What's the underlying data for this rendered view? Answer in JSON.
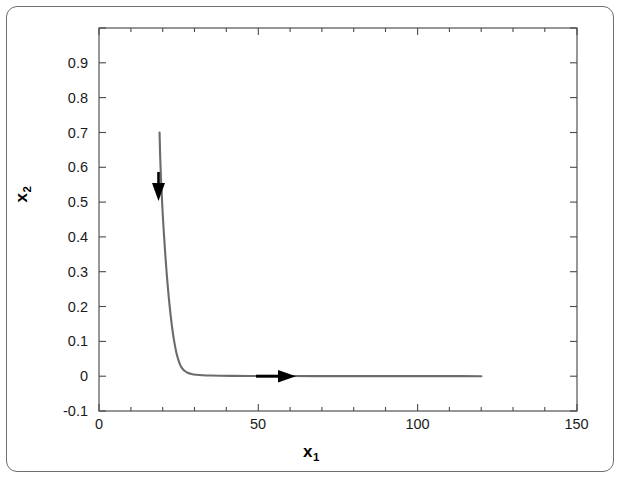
{
  "figure": {
    "background_color": "#ffffff",
    "frame_color": "#6f6f6f",
    "curve_color": "#6b6b6b",
    "arrow_color": "#000000",
    "axis_color": "#4a4a4a"
  },
  "axes": {
    "x_title": "x",
    "x_title_sub": "1",
    "y_title": "x",
    "y_title_sub": "2"
  },
  "ticks": {
    "x_labels": [
      "0",
      "50",
      "100",
      "150"
    ],
    "y_labels": [
      "0.9",
      "0.8",
      "0.7",
      "0.6",
      "0.5",
      "0.4",
      "0.3",
      "0.2",
      "0.1",
      "0",
      "-0.1"
    ]
  },
  "chart_data": {
    "type": "line",
    "title": "",
    "subtitle": "",
    "xlabel": "x1",
    "ylabel": "x2",
    "xlim": [
      0,
      150
    ],
    "ylim": [
      -0.1,
      1.0
    ],
    "xticks": [
      0,
      50,
      100,
      150
    ],
    "yticks": [
      -0.1,
      0,
      0.1,
      0.2,
      0.3,
      0.4,
      0.5,
      0.6,
      0.7,
      0.8,
      0.9,
      1.0
    ],
    "xtick_labels": [
      "0",
      "50",
      "100",
      "150"
    ],
    "ytick_labels": [
      "-0.1",
      "0",
      "0.1",
      "0.2",
      "0.3",
      "0.4",
      "0.5",
      "0.6",
      "0.7",
      "0.8",
      "0.9",
      ""
    ],
    "x_minor_ticks": [
      10,
      20,
      30,
      40,
      60,
      70,
      80,
      90,
      110,
      120,
      130,
      140
    ],
    "grid": false,
    "legend": null,
    "legend_position": "none",
    "series": [
      {
        "name": "trajectory",
        "color": "#6b6b6b",
        "linewidth": 2.1,
        "x": [
          19.0,
          19.1,
          19.2,
          19.4,
          19.7,
          20.0,
          20.4,
          20.8,
          21.2,
          21.6,
          22.0,
          22.4,
          22.8,
          23.2,
          23.6,
          24.0,
          24.4,
          24.9,
          25.4,
          26.0,
          26.8,
          27.8,
          29.0,
          30.5,
          32.5,
          35.0,
          38.0,
          42.0,
          47.0,
          53.0,
          60.0,
          68.0,
          77.0,
          87.0,
          98.0,
          109.0,
          120.0
        ],
        "y": [
          0.7,
          0.665,
          0.63,
          0.58,
          0.52,
          0.465,
          0.405,
          0.35,
          0.3,
          0.256,
          0.216,
          0.181,
          0.15,
          0.123,
          0.1,
          0.08,
          0.063,
          0.047,
          0.034,
          0.024,
          0.0155,
          0.01,
          0.0065,
          0.0042,
          0.0028,
          0.0019,
          0.0013,
          0.0009,
          0.0007,
          0.0005,
          0.0004,
          0.0003,
          0.0002,
          0.0002,
          0.0001,
          0.0001,
          0.0
        ]
      }
    ],
    "annotations": [
      {
        "name": "down-arrow",
        "kind": "arrow",
        "direction": "down",
        "x": 19.1,
        "y_from": 0.6,
        "y_to": 0.525,
        "description": "direction-of-flow arrow on descending branch"
      },
      {
        "name": "right-arrow",
        "kind": "arrow",
        "direction": "right",
        "y": 0.0,
        "x_from": 50.0,
        "x_to": 62.5,
        "description": "direction-of-flow arrow on horizontal branch"
      }
    ]
  }
}
